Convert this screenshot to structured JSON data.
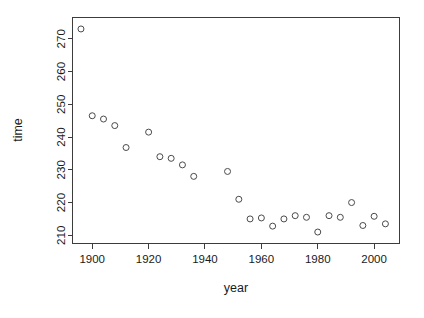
{
  "chart_data": {
    "type": "scatter",
    "title": "",
    "xlabel": "year",
    "ylabel": "time",
    "xlim": [
      1893,
      2009
    ],
    "ylim": [
      207.5,
      276.5
    ],
    "grid": false,
    "legend": null,
    "x_ticks": [
      1900,
      1920,
      1940,
      1960,
      1980,
      2000
    ],
    "x_tick_labels": [
      "1900",
      "1920",
      "1940",
      "1960",
      "1980",
      "2000"
    ],
    "y_ticks": [
      210,
      220,
      230,
      240,
      250,
      260,
      270
    ],
    "y_tick_labels": [
      "210",
      "220",
      "230",
      "240",
      "250",
      "260",
      "270"
    ],
    "point_marker": "open-circle",
    "point_radius": 3,
    "point_color": "#4a4a4a",
    "x": [
      1896,
      1900,
      1904,
      1908,
      1912,
      1920,
      1924,
      1928,
      1932,
      1936,
      1948,
      1952,
      1956,
      1960,
      1964,
      1968,
      1972,
      1976,
      1980,
      1984,
      1988,
      1992,
      1996,
      2000,
      2004
    ],
    "y": [
      273.0,
      246.5,
      245.5,
      243.5,
      236.8,
      241.5,
      234.0,
      233.5,
      231.5,
      228.0,
      229.5,
      221.0,
      215.0,
      215.3,
      212.8,
      215.0,
      216.0,
      215.5,
      211.0,
      216.0,
      215.5,
      220.0,
      213.0,
      215.8,
      213.5
    ],
    "series_name": "olympic-marathon-times",
    "n_points": 25
  },
  "axis": {
    "x_title": "year",
    "y_title": "time"
  }
}
